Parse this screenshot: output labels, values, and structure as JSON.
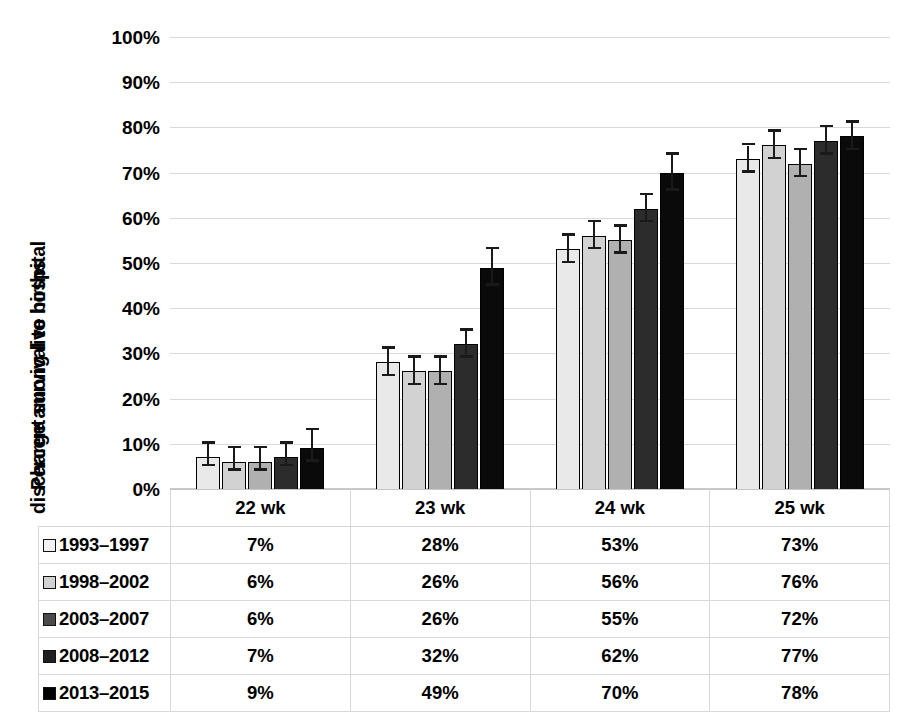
{
  "chart_data": {
    "type": "bar",
    "title": "",
    "xlabel": "",
    "ylabel": "Percent survival to hospital discharge among live births",
    "ylabel_lines": [
      "Percent survival to hospital",
      "discharge among live births"
    ],
    "ylim": [
      0,
      100
    ],
    "yticks": [
      "0%",
      "10%",
      "20%",
      "30%",
      "40%",
      "50%",
      "60%",
      "70%",
      "80%",
      "90%",
      "100%"
    ],
    "ytick_values": [
      0,
      10,
      20,
      30,
      40,
      50,
      60,
      70,
      80,
      90,
      100
    ],
    "grid": true,
    "legend_position": "table-left-column",
    "categories": [
      "22 wk",
      "23 wk",
      "24 wk",
      "25 wk"
    ],
    "series": [
      {
        "name": "1993-1997",
        "color": "#e9e9e9",
        "values": [
          7,
          28,
          53,
          73
        ],
        "labels": [
          "7%",
          "28%",
          "53%",
          "73%"
        ],
        "err_low": [
          2,
          3,
          3,
          3
        ],
        "err_high": [
          3,
          3,
          3,
          3
        ]
      },
      {
        "name": "1998-2002",
        "color": "#d2d2d2",
        "values": [
          6,
          26,
          56,
          76
        ],
        "labels": [
          "6%",
          "26%",
          "56%",
          "76%"
        ],
        "err_low": [
          2,
          3,
          3,
          3
        ],
        "err_high": [
          3,
          3,
          3,
          3
        ]
      },
      {
        "name": "2003-2007",
        "color": "#b0b0b0",
        "values": [
          6,
          26,
          55,
          72
        ],
        "labels": [
          "6%",
          "26%",
          "55%",
          "72%"
        ],
        "err_low": [
          2,
          3,
          3,
          3
        ],
        "err_high": [
          3,
          3,
          3,
          3
        ]
      },
      {
        "name": "2008-2012",
        "color": "#2c2c2c",
        "values": [
          7,
          32,
          62,
          77
        ],
        "labels": [
          "7%",
          "32%",
          "62%",
          "77%"
        ],
        "err_low": [
          2,
          3,
          3,
          3
        ],
        "err_high": [
          3,
          3,
          3,
          3
        ]
      },
      {
        "name": "2013-2015",
        "color": "#0a0a0a",
        "values": [
          9,
          49,
          70,
          78
        ],
        "labels": [
          "9%",
          "49%",
          "70%",
          "78%"
        ],
        "err_low": [
          3,
          4,
          4,
          3
        ],
        "err_high": [
          4,
          4,
          4,
          3
        ]
      }
    ]
  },
  "table": {
    "corner_label": "",
    "column_headers": [
      "22 wk",
      "23 wk",
      "24 wk",
      "25 wk"
    ],
    "rows": [
      {
        "label": "1993–1997",
        "swatch": "#f2f2f2",
        "values": [
          "7%",
          "28%",
          "53%",
          "73%"
        ]
      },
      {
        "label": "1998–2002",
        "swatch": "#d2d2d2",
        "values": [
          "6%",
          "26%",
          "56%",
          "76%"
        ]
      },
      {
        "label": "2003–2007",
        "swatch": "#4a4a4a",
        "values": [
          "6%",
          "26%",
          "55%",
          "72%"
        ]
      },
      {
        "label": "2008–2012",
        "swatch": "#1f1f1f",
        "values": [
          "7%",
          "32%",
          "62%",
          "77%"
        ]
      },
      {
        "label": "2013–2015",
        "swatch": "#000000",
        "values": [
          "9%",
          "49%",
          "70%",
          "78%"
        ]
      }
    ]
  },
  "style": {
    "grid_color": "#d9d9d9",
    "bar_outline": "#000000",
    "error_bar_color": "#1a1a1a",
    "table_border": "#d8d8d8",
    "background": "#ffffff"
  }
}
